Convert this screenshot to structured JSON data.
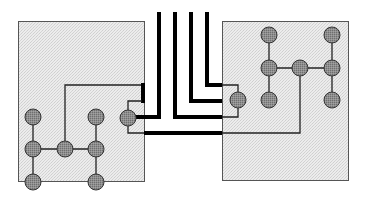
{
  "diagram": {
    "colors": {
      "background": "#ffffff",
      "box_fill": "#e6e6e6",
      "box_stroke": "#555555",
      "node_fill": "#8c8c8c",
      "node_stroke": "#333333",
      "wire_thin": "#111111",
      "wire_thick": "#000000"
    },
    "boxes": [
      {
        "id": "left-module",
        "x": 18,
        "y": 21,
        "w": 126,
        "h": 160
      },
      {
        "id": "right-module",
        "x": 222,
        "y": 21,
        "w": 126,
        "h": 159
      }
    ],
    "nodes": [
      {
        "id": "L-a1",
        "cx": 33,
        "cy": 117
      },
      {
        "id": "L-a2",
        "cx": 33,
        "cy": 149
      },
      {
        "id": "L-a3",
        "cx": 33,
        "cy": 182
      },
      {
        "id": "L-b",
        "cx": 65,
        "cy": 149
      },
      {
        "id": "L-c1",
        "cx": 96,
        "cy": 117
      },
      {
        "id": "L-c2",
        "cx": 96,
        "cy": 149
      },
      {
        "id": "L-c3",
        "cx": 96,
        "cy": 182
      },
      {
        "id": "L-port",
        "cx": 128,
        "cy": 118
      },
      {
        "id": "R-a1",
        "cx": 269,
        "cy": 35
      },
      {
        "id": "R-a2",
        "cx": 269,
        "cy": 68
      },
      {
        "id": "R-a3",
        "cx": 269,
        "cy": 100
      },
      {
        "id": "R-b",
        "cx": 300,
        "cy": 68
      },
      {
        "id": "R-c1",
        "cx": 332,
        "cy": 35
      },
      {
        "id": "R-c2",
        "cx": 332,
        "cy": 68
      },
      {
        "id": "R-c3",
        "cx": 332,
        "cy": 100
      },
      {
        "id": "R-port",
        "cx": 238,
        "cy": 100
      }
    ],
    "node_radius": 8,
    "buses": [
      {
        "id": "bus-1",
        "x": 159,
        "y_top": 12,
        "path": "159,12 159,118 136,118"
      },
      {
        "id": "bus-2",
        "x": 175,
        "y_top": 12,
        "path": "175,12 175,117 222,117"
      },
      {
        "id": "bus-3",
        "x": 191,
        "y_top": 12,
        "path": "191,12 191,101 222,101"
      },
      {
        "id": "bus-4",
        "x": 207,
        "y_top": 12,
        "path": "207,12 207,85 222,85"
      },
      {
        "id": "bus-5",
        "x": 144,
        "y_top": 133,
        "path": "144,133 222,133"
      }
    ]
  }
}
